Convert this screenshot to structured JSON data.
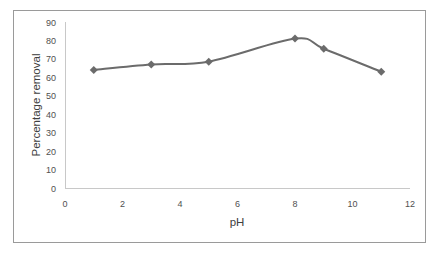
{
  "chart_data": {
    "type": "line",
    "title": "",
    "xlabel": "pH",
    "ylabel": "Percentage removal",
    "xlim": [
      0,
      12
    ],
    "ylim": [
      0,
      90
    ],
    "x_ticks": [
      0,
      2,
      4,
      6,
      8,
      10,
      12
    ],
    "y_ticks": [
      0,
      10,
      20,
      30,
      40,
      50,
      60,
      70,
      80,
      90
    ],
    "grid": false,
    "legend": null,
    "series": [
      {
        "name": "Percentage removal",
        "marker": "diamond",
        "smooth": true,
        "color": "#6b6b6b",
        "x": [
          1,
          3,
          5,
          8,
          9,
          11
        ],
        "values": [
          64,
          67,
          68.5,
          81,
          75.5,
          63
        ]
      }
    ]
  }
}
